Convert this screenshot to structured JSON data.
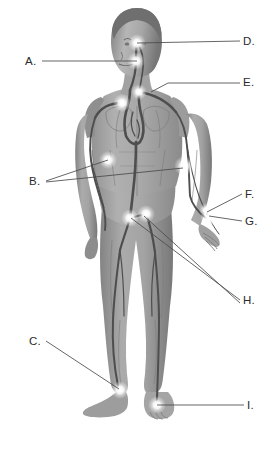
{
  "image": {
    "kind": "anatomical-illustration",
    "subject": "human-body-pulse-points",
    "view": "anterior-full-body",
    "width": 274,
    "height": 456,
    "background_color": "#ffffff",
    "body_color": "#9a9a9a",
    "vessel_color": "#4f4f4f",
    "highlight_color": "#ffffff",
    "leader_line_color": "#4a4a4a",
    "label_text_color": "#2b2b2b"
  },
  "labels": [
    {
      "id": "A",
      "text": "A.",
      "x": 25,
      "y": 56
    },
    {
      "id": "B",
      "text": "B.",
      "x": 29,
      "y": 176
    },
    {
      "id": "C",
      "text": "C.",
      "x": 29,
      "y": 336
    },
    {
      "id": "D",
      "text": "D.",
      "x": 243,
      "y": 36
    },
    {
      "id": "E",
      "text": "E.",
      "x": 243,
      "y": 77
    },
    {
      "id": "F",
      "text": "F.",
      "x": 245,
      "y": 189
    },
    {
      "id": "G",
      "text": "G.",
      "x": 245,
      "y": 216
    },
    {
      "id": "H",
      "text": "H.",
      "x": 243,
      "y": 295
    },
    {
      "id": "I",
      "text": "I.",
      "x": 247,
      "y": 400
    }
  ],
  "leader_lines": [
    {
      "label": "A",
      "points": "42,61 137,61"
    },
    {
      "label": "B",
      "points": "46,181 108,160"
    },
    {
      "label": "B",
      "points": "46,182 183,168"
    },
    {
      "label": "C",
      "points": "46,341 119,389"
    },
    {
      "label": "D",
      "points": "240,41 137,43"
    },
    {
      "label": "E",
      "points": "240,83 168,83 151,92"
    },
    {
      "label": "F",
      "points": "242,194 207,212"
    },
    {
      "label": "G",
      "points": "242,221 209,216"
    },
    {
      "label": "H",
      "points": "240,300 131,218"
    },
    {
      "label": "H",
      "points": "240,303 144,216"
    },
    {
      "label": "I",
      "points": "244,405 157,405"
    }
  ],
  "pulse_points": [
    {
      "for_label": "D",
      "x": 137,
      "y": 43,
      "r": 7
    },
    {
      "for_label": "A",
      "x": 136,
      "y": 61,
      "r": 7
    },
    {
      "for_label": "E",
      "x": 139,
      "y": 92,
      "r": 6
    },
    {
      "for_label": "E",
      "x": 122,
      "y": 103,
      "r": 7
    },
    {
      "for_label": "B",
      "x": 108,
      "y": 160,
      "r": 7
    },
    {
      "for_label": "B",
      "x": 184,
      "y": 166,
      "r": 8
    },
    {
      "for_label": "F",
      "x": 206,
      "y": 210,
      "r": 5
    },
    {
      "for_label": "G",
      "x": 209,
      "y": 218,
      "r": 7
    },
    {
      "for_label": "H",
      "x": 130,
      "y": 218,
      "r": 7
    },
    {
      "for_label": "H",
      "x": 146,
      "y": 214,
      "r": 7
    },
    {
      "for_label": "C",
      "x": 120,
      "y": 390,
      "r": 7
    },
    {
      "for_label": "I",
      "x": 157,
      "y": 405,
      "r": 7
    }
  ]
}
